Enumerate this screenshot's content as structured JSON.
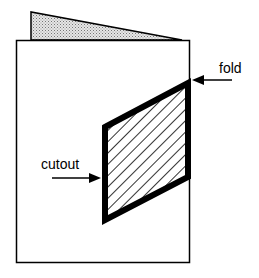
{
  "diagram": {
    "labels": {
      "fold": "fold",
      "cutout": "cutout"
    },
    "colors": {
      "stroke": "#000000",
      "back_flap_fill": "#bdbdbd",
      "paper": "#ffffff"
    }
  }
}
